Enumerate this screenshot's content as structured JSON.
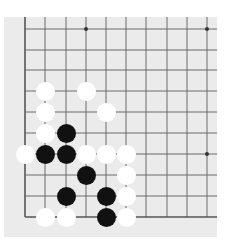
{
  "board": {
    "background": "#ebebeb",
    "line_color": "#6a6a6a",
    "edge_color": "#555555",
    "columns_x": [
      25,
      45,
      66,
      86,
      106,
      126,
      146,
      167,
      187,
      207
    ],
    "rows_y": [
      29,
      50,
      70,
      91,
      112,
      133,
      154,
      175,
      196,
      217
    ],
    "left_edge_is_border": true,
    "bottom_edge_is_border": true,
    "star_points": [
      [
        3,
        0
      ],
      [
        9,
        0
      ],
      [
        9,
        6
      ]
    ],
    "stones": [
      {
        "color": "white",
        "col": 1,
        "row": 3
      },
      {
        "color": "white",
        "col": 3,
        "row": 3
      },
      {
        "color": "white",
        "col": 1,
        "row": 4
      },
      {
        "color": "white",
        "col": 4,
        "row": 4
      },
      {
        "color": "white",
        "col": 1,
        "row": 5
      },
      {
        "color": "black",
        "col": 2,
        "row": 5
      },
      {
        "color": "white",
        "col": 0,
        "row": 6
      },
      {
        "color": "black",
        "col": 1,
        "row": 6
      },
      {
        "color": "black",
        "col": 2,
        "row": 6
      },
      {
        "color": "white",
        "col": 3,
        "row": 6
      },
      {
        "color": "white",
        "col": 4,
        "row": 6
      },
      {
        "color": "white",
        "col": 5,
        "row": 6
      },
      {
        "color": "black",
        "col": 3,
        "row": 7
      },
      {
        "color": "white",
        "col": 5,
        "row": 7
      },
      {
        "color": "black",
        "col": 2,
        "row": 8
      },
      {
        "color": "black",
        "col": 4,
        "row": 8
      },
      {
        "color": "white",
        "col": 5,
        "row": 8
      },
      {
        "color": "white",
        "col": 1,
        "row": 9
      },
      {
        "color": "white",
        "col": 2,
        "row": 9
      },
      {
        "color": "black",
        "col": 4,
        "row": 9
      },
      {
        "color": "white",
        "col": 5,
        "row": 9
      }
    ]
  }
}
